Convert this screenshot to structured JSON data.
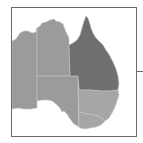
{
  "map": {
    "title": "",
    "region": "Australia",
    "colors": {
      "background": "#ffffff",
      "frame": "#6a6a6a",
      "border": "#c4c4c4",
      "default_fill": "#9b9b9b",
      "highlight_fill": "#6f6f6f",
      "light_fill": "#a6a6a6"
    },
    "states": [
      {
        "name": "Western Australia",
        "shade": "default"
      },
      {
        "name": "Northern Territory",
        "shade": "default"
      },
      {
        "name": "South Australia",
        "shade": "default"
      },
      {
        "name": "Queensland",
        "shade": "highlight"
      },
      {
        "name": "New South Wales",
        "shade": "light"
      },
      {
        "name": "Victoria",
        "shade": "light"
      }
    ]
  }
}
